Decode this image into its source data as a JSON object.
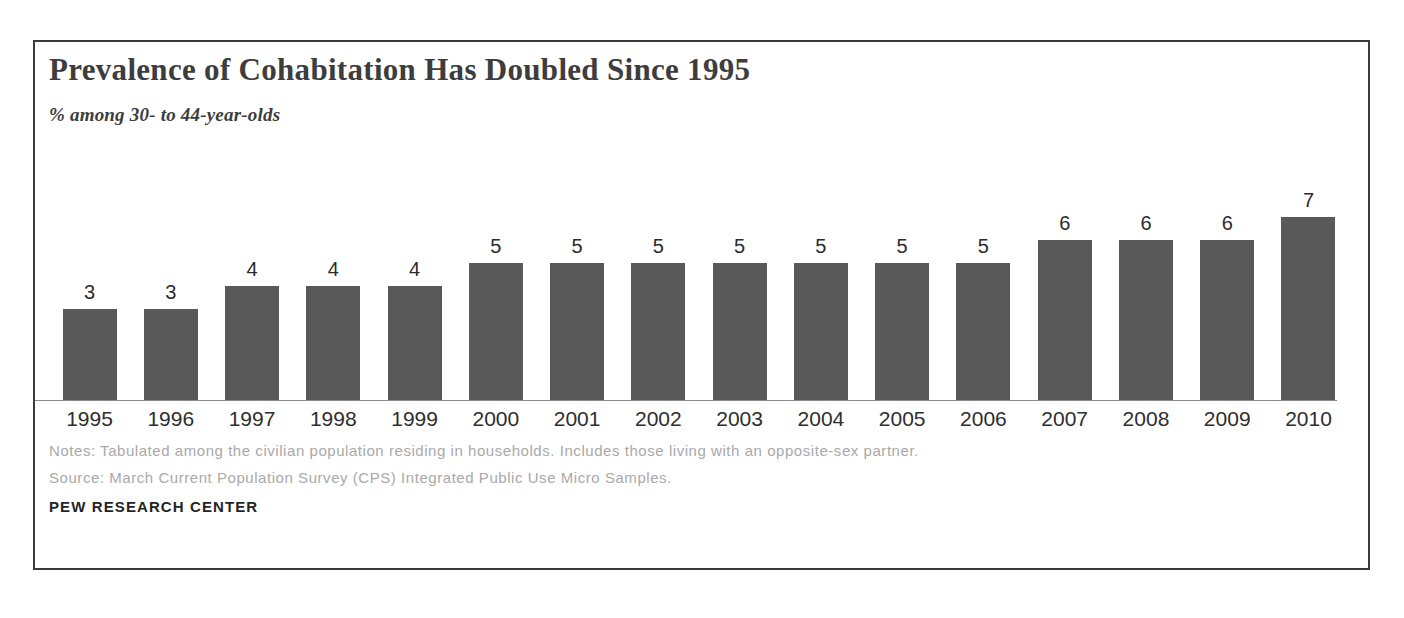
{
  "chart_data": {
    "type": "bar",
    "title": "Prevalence of Cohabitation Has Doubled Since 1995",
    "subtitle": "% among 30- to 44-year-olds",
    "xlabel": "",
    "ylabel": "",
    "ylim": [
      0,
      8
    ],
    "grid": false,
    "legend": "none",
    "bar_color": "#595959",
    "categories": [
      "1995",
      "1996",
      "1997",
      "1998",
      "1999",
      "2000",
      "2001",
      "2002",
      "2003",
      "2004",
      "2005",
      "2006",
      "2007",
      "2008",
      "2009",
      "2010"
    ],
    "values": [
      3,
      3,
      4,
      4,
      4,
      5,
      5,
      5,
      5,
      5,
      5,
      5,
      6,
      6,
      6,
      7
    ],
    "data_labels": [
      "3",
      "3",
      "4",
      "4",
      "4",
      "5",
      "5",
      "5",
      "5",
      "5",
      "5",
      "5",
      "6",
      "6",
      "6",
      "7"
    ]
  },
  "footer": {
    "notes": "Notes: Tabulated among the civilian population residing in households. Includes those living with an opposite-sex partner.",
    "source": "Source: March Current Population Survey (CPS) Integrated Public Use Micro Samples.",
    "brand": "PEW RESEARCH CENTER"
  }
}
